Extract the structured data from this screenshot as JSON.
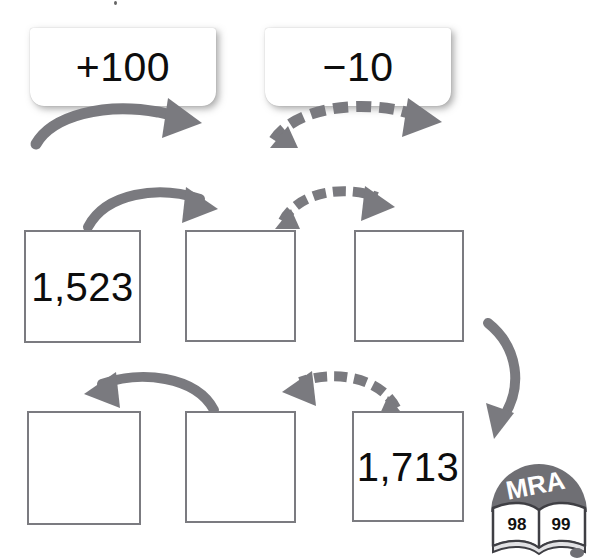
{
  "worksheet": {
    "background_color": "#ffffff",
    "ink_color": "#0d0d0d",
    "arrow_color": "#7a7a7f",
    "box_border_color": "#7b7b80"
  },
  "legend": {
    "items": [
      {
        "label": "+100",
        "arrow_style": "solid",
        "arrow_direction": "right"
      },
      {
        "label": "−10",
        "arrow_style": "dashed",
        "arrow_direction": "right"
      }
    ]
  },
  "rows": [
    {
      "name": "top-row",
      "arrow_direction": "right",
      "cells": [
        {
          "value": "1,523",
          "filled": true
        },
        {
          "value": "",
          "filled": false
        },
        {
          "value": "",
          "filled": false
        }
      ],
      "connectors": [
        {
          "from": 1,
          "to": 2,
          "style": "solid",
          "direction": "right",
          "operation": "+100"
        },
        {
          "from": 2,
          "to": 3,
          "style": "dashed",
          "direction": "right",
          "operation": "−10"
        }
      ]
    },
    {
      "name": "bottom-row",
      "arrow_direction": "left",
      "cells": [
        {
          "value": "",
          "filled": false
        },
        {
          "value": "",
          "filled": false
        },
        {
          "value": "1,713",
          "filled": true
        }
      ],
      "connectors": [
        {
          "from": 2,
          "to": 1,
          "style": "solid",
          "direction": "left",
          "operation": "+100"
        },
        {
          "from": 3,
          "to": 2,
          "style": "dashed",
          "direction": "left",
          "operation": "−10"
        }
      ]
    }
  ],
  "row_link": {
    "style": "solid",
    "direction": "down-left",
    "description": "curve from end of top row to start of bottom row"
  },
  "logo": {
    "brand": "MRA",
    "page_numbers": "98 99",
    "clipped": true
  }
}
